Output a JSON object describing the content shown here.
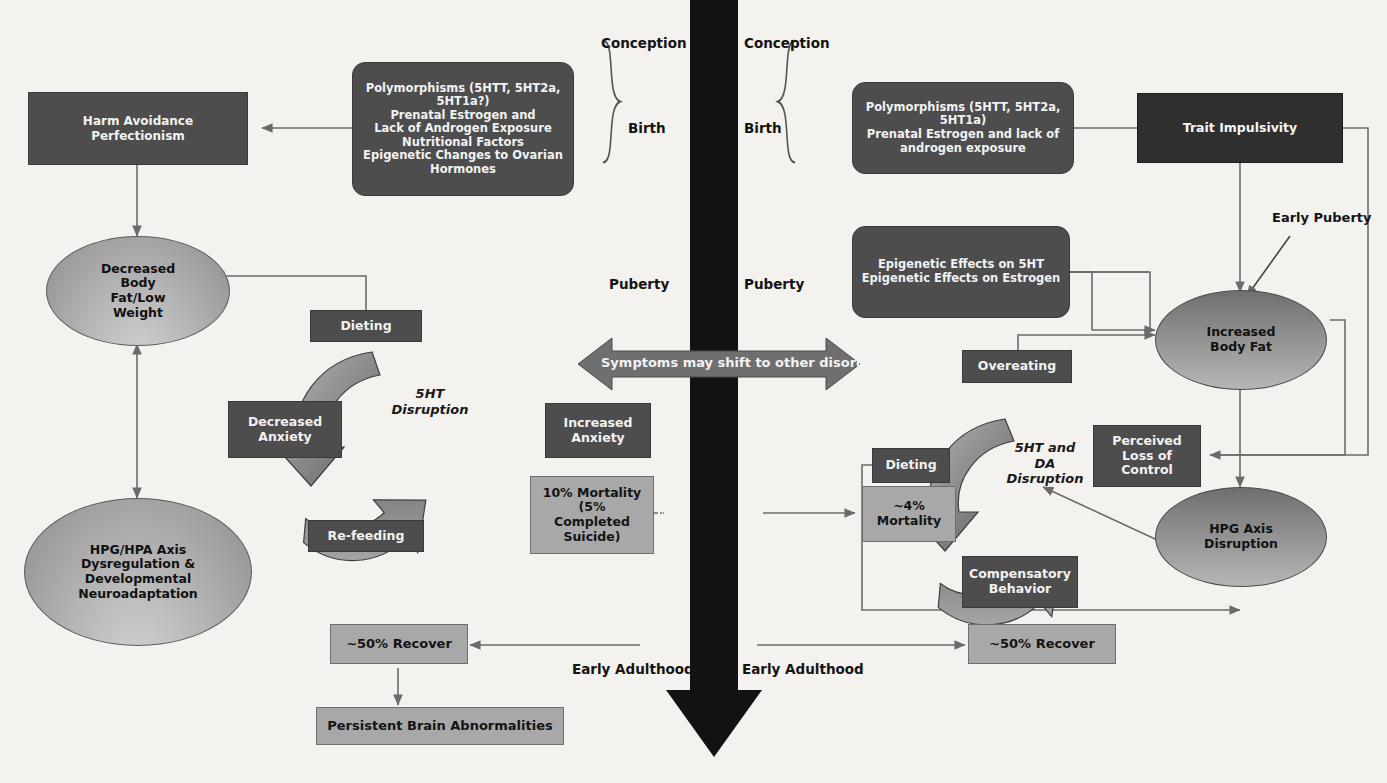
{
  "diagram": {
    "title_absent": true,
    "timeline": {
      "left_labels": [
        "Conception",
        "Birth",
        "Puberty",
        "Early Adulthood"
      ],
      "right_labels": [
        "Conception",
        "Birth",
        "Puberty",
        "Early Adulthood"
      ],
      "arrow_direction": "down",
      "arrow_color": "#111111"
    },
    "left_branch": {
      "risk_box": "Polymorphisms (5HTT, 5HT2a, 5HT1a?)\nPrenatal Estrogen and\nLack of Androgen Exposure\nNutritional Factors\nEpigenetic Changes to Ovarian\nHormones",
      "trait_box": "Harm Avoidance\nPerfectionism",
      "body_ellipse": "Decreased\nBody\nFat/Low\nWeight",
      "axis_ellipse": "HPG/HPA Axis\nDysregulation &\nDevelopmental\nNeuroadaptation",
      "dieting": "Dieting",
      "refeeding": "Re-feeding",
      "decreased_anxiety": "Decreased\nAnxiety",
      "increased_anxiety": "Increased\nAnxiety",
      "cycle_label": "5HT\nDisruption",
      "mortality": "10% Mortality\n(5%\nCompleted\nSuicide)",
      "recover": "~50% Recover",
      "persistent": "Persistent Brain Abnormalities"
    },
    "right_branch": {
      "risk_box": "Polymorphisms (5HTT, 5HT2a,\n5HT1a)\nPrenatal Estrogen and lack of\nandrogen exposure",
      "epigenetic_box": "Epigenetic Effects on 5HT\nEpigenetic Effects on Estrogen",
      "trait_box": "Trait Impulsivity",
      "early_puberty": "Early Puberty",
      "body_ellipse": "Increased\nBody Fat",
      "axis_ellipse": "HPG Axis\nDisruption",
      "overeating": "Overeating",
      "dieting": "Dieting",
      "compensatory": "Compensatory\nBehavior",
      "perceived_loss": "Perceived\nLoss of\nControl",
      "cycle_label": "5HT and\nDA\nDisruption",
      "mortality": "~4%\nMortality",
      "recover": "~50% Recover"
    },
    "center": {
      "shift_arrow_label": "Symptoms may shift to other disorder"
    },
    "colors": {
      "dark_box": "#4d4d4d",
      "darker_box": "#2f2f2f",
      "light_box": "#a8a8a8",
      "background": "#f3f2ef",
      "connector": "#6b6b6b"
    }
  }
}
